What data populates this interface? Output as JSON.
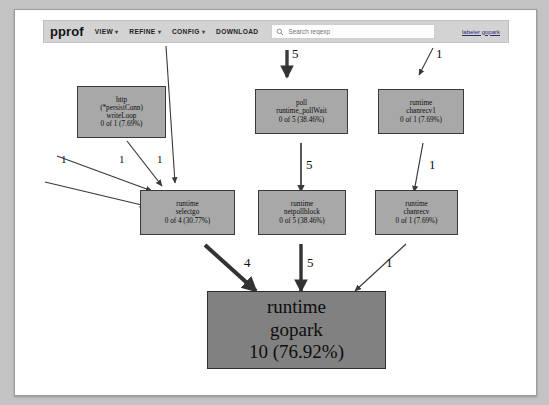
{
  "window": {
    "background": "#c3c3c3",
    "sheet_background": "#ffffff"
  },
  "toolbar": {
    "brand": "pprof",
    "menus": [
      {
        "label": "VIEW",
        "caret": "▾"
      },
      {
        "label": "REFINE",
        "caret": "▾"
      },
      {
        "label": "CONFIG",
        "caret": "▾"
      },
      {
        "label": "DOWNLOAD",
        "caret": ""
      }
    ],
    "search": {
      "placeholder": "Search regexp",
      "value": "",
      "icon": "search-icon"
    },
    "profile_link": "labeler gopark"
  },
  "graph": {
    "colors": {
      "node_fill": "#a8a8a8",
      "node_fill_hot": "#818181",
      "node_border": "#3a3a3a",
      "edge": "#3a3a3a",
      "text": "#0d0d0d"
    },
    "nodes": [
      {
        "id": "http-writeloop",
        "lines": [
          "http",
          "(*persistConn)",
          "writeLoop",
          "0 of 1 (7.69%)"
        ],
        "value": 1,
        "percent": "7.69%"
      },
      {
        "id": "poll-pollwait",
        "lines": [
          "poll",
          "runtime_pollWait",
          "0 of 5 (38.46%)"
        ],
        "value": 5,
        "percent": "38.46%"
      },
      {
        "id": "runtime-chanrecv1",
        "lines": [
          "runtime",
          "chanrecv1",
          "0 of 1 (7.69%)"
        ],
        "value": 1,
        "percent": "7.69%"
      },
      {
        "id": "runtime-selectgo",
        "lines": [
          "runtime",
          "selectgo",
          "0 of 4 (30.77%)"
        ],
        "value": 4,
        "percent": "30.77%"
      },
      {
        "id": "runtime-netpollblock",
        "lines": [
          "runtime",
          "netpollblock",
          "0 of 5 (38.46%)"
        ],
        "value": 5,
        "percent": "38.46%"
      },
      {
        "id": "runtime-chanrecv",
        "lines": [
          "runtime",
          "chanrecv",
          "0 of 1 (7.69%)"
        ],
        "value": 1,
        "percent": "7.69%"
      },
      {
        "id": "runtime-gopark",
        "lines": [
          "runtime",
          "gopark",
          "10 (76.92%)"
        ],
        "value": 10,
        "percent": "76.92%"
      }
    ],
    "edge_labels": {
      "in_poll": "5",
      "in_chanrecv1": "1",
      "writeloop_to_selectgo": "1",
      "left_to_selectgo_a": "1",
      "left_to_selectgo_b": "1",
      "poll_to_netpollblock": "5",
      "chanrecv1_to_chanrecv": "1",
      "selectgo_to_gopark": "4",
      "netpollblock_to_gopark": "5",
      "chanrecv_to_gopark": "1"
    }
  }
}
